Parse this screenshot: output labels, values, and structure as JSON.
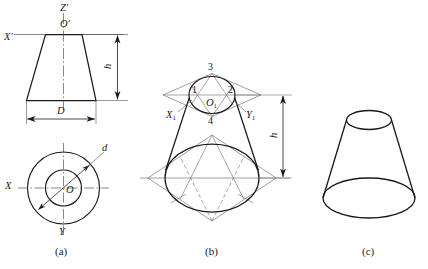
{
  "figure": {
    "background_color": "#ffffff",
    "line_color": "#1a1a1a",
    "thin_line_color": "#555555",
    "panels": [
      {
        "id": "a",
        "caption": "(a)",
        "description": "Two-view orthographic drawing: front view trapezoid with height h and bottom diameter D, top view two concentric circles with diameter d",
        "labels": {
          "z_axis": "Z′",
          "origin": "O′",
          "x_axis": "X′",
          "height_dim": "h",
          "diameter_dim": "D",
          "small_diameter": "d",
          "x_axis_top": "X",
          "y_axis_top": "Y",
          "origin_top": "O"
        }
      },
      {
        "id": "b",
        "caption": "(b)",
        "description": "Isometric construction using four-center ellipse method: rhombus with construction points 1,2,3,4 for top ellipse and bottom ellipse, joined by tangent outlines",
        "labels": {
          "point_1": "1",
          "point_2": "2",
          "point_3": "3",
          "point_4": "4",
          "origin": "O",
          "origin_sub": "1",
          "x_axis": "X",
          "x_axis_sub": "1",
          "y_axis": "Y",
          "y_axis_sub": "1",
          "height_dim": "h"
        }
      },
      {
        "id": "c",
        "caption": "(c)",
        "description": "Finished isometric pictorial of the truncated cone with construction lines removed",
        "labels": {}
      }
    ]
  }
}
